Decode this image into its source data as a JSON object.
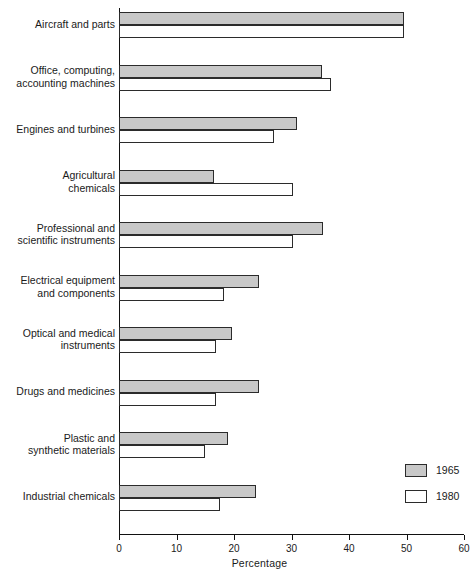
{
  "chart_data": {
    "type": "bar",
    "orientation": "horizontal",
    "title": "",
    "xlabel": "Percentage",
    "ylabel": "",
    "xlim": [
      0,
      60
    ],
    "xticks": [
      0,
      10,
      20,
      30,
      40,
      50,
      60
    ],
    "xtick_labels": [
      "0",
      "10",
      "20",
      "30",
      "40",
      "50",
      "60"
    ],
    "grid": false,
    "legend_position": "bottom-right",
    "categories": [
      "Aircraft and parts",
      "Office, computing, accounting machines",
      "Engines and turbines",
      "Agricultural chemicals",
      "Professional and scientific instruments",
      "Electrical equipment and components",
      "Optical and medical instruments",
      "Drugs and medicines",
      "Plastic and synthetic materials",
      "Industrial chemicals"
    ],
    "category_lines": [
      [
        "Aircraft and parts"
      ],
      [
        "Office, computing,",
        "accounting machines"
      ],
      [
        "Engines and turbines"
      ],
      [
        "Agricultural",
        "chemicals"
      ],
      [
        "Professional and",
        "scientific instruments"
      ],
      [
        "Electrical equipment",
        "and components"
      ],
      [
        "Optical and medical",
        "instruments"
      ],
      [
        "Drugs and medicines"
      ],
      [
        "Plastic and",
        "synthetic materials"
      ],
      [
        "Industrial chemicals"
      ]
    ],
    "series": [
      {
        "name": "1965",
        "color": "#c8c8c8",
        "values": [
          49.5,
          35.3,
          31.0,
          16.5,
          35.5,
          24.3,
          19.7,
          24.4,
          19.0,
          23.8
        ]
      },
      {
        "name": "1980",
        "color": "#ffffff",
        "values": [
          49.5,
          36.8,
          27.0,
          30.2,
          30.3,
          18.2,
          16.8,
          16.9,
          15.0,
          17.5
        ]
      }
    ]
  },
  "legend": {
    "entries": [
      {
        "label": "1965",
        "swatch": "gray"
      },
      {
        "label": "1980",
        "swatch": "white"
      }
    ]
  }
}
